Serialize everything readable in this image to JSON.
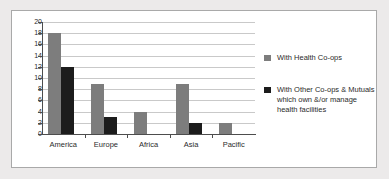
{
  "chart_data": {
    "type": "bar",
    "title": "",
    "xlabel": "",
    "ylabel": "",
    "categories": [
      "America",
      "Europe",
      "Africa",
      "Asia",
      "Pacific"
    ],
    "series": [
      {
        "name": "With Health Co-ops",
        "color": "#7d7d7d",
        "values": [
          18,
          9,
          4,
          9,
          2
        ]
      },
      {
        "name": "With Other Co-ops & Mutuals which own &/or manage health facilities",
        "color": "#1c1c1c",
        "values": [
          12,
          3,
          0,
          2,
          0
        ]
      }
    ],
    "ylim": [
      0,
      20
    ],
    "ytick_step": 2,
    "ytick_labels": [
      "0",
      "2",
      "4",
      "6",
      "8",
      "10",
      "12",
      "14",
      "16",
      "18",
      "20"
    ],
    "grid": true,
    "legend_position": "right"
  },
  "legend": {
    "entries": [
      {
        "label": "With Health Co-ops",
        "swatch": "series-0"
      },
      {
        "label": "With Other Co-ops & Mutuals which own &/or manage health facilities",
        "swatch": "series-1"
      }
    ]
  }
}
